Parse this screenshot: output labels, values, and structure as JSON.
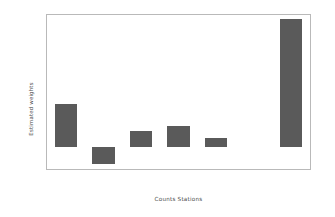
{
  "chart_data": {
    "type": "bar",
    "title": "",
    "xlabel": "Counts Stations",
    "ylabel": "Estimated weights",
    "categories": [
      "Lane1_28",
      "Lane2_28",
      "Lane1_74",
      "Lane2_74",
      "Lane1_137",
      "Lane2_137",
      "Lane1_138"
    ],
    "values": [
      0.195,
      -0.075,
      0.075,
      0.095,
      0.04,
      0.0,
      0.58
    ],
    "ylim": [
      -0.1,
      0.6
    ],
    "yticks": [
      -0.1,
      0.0,
      0.1,
      0.2,
      0.3,
      0.4,
      0.5,
      0.6
    ],
    "ytick_labels": [
      "-0.1",
      "0.0",
      "0.1",
      "0.2",
      "0.3",
      "0.4",
      "0.5",
      "0.6"
    ],
    "grid": false,
    "legend": null,
    "bar_color": "#5a5a5a",
    "axes_color": "#b9b9b9",
    "background": "#ffffff"
  }
}
